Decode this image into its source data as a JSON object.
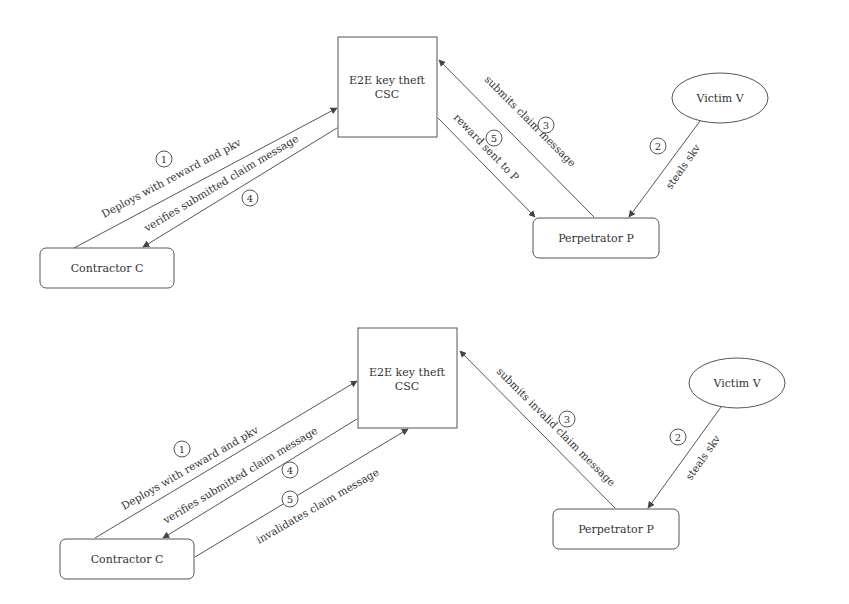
{
  "diagrams": [
    {
      "id": "top",
      "nodes": {
        "csc": {
          "line1": "E2E key theft",
          "line2": "CSC"
        },
        "contractor": {
          "label": "Contractor C"
        },
        "perpetrator": {
          "label": "Perpetrator P"
        },
        "victim": {
          "label": "Victim V"
        }
      },
      "edges": [
        {
          "step": "1",
          "label": "Deploys with reward and pkv",
          "from": "Contractor C",
          "to": "E2E key theft CSC"
        },
        {
          "step": "2",
          "label": "steals skv",
          "from": "Victim V",
          "to": "Perpetrator P"
        },
        {
          "step": "3",
          "label": "submits claim message",
          "from": "Perpetrator P",
          "to": "E2E key theft CSC"
        },
        {
          "step": "4",
          "label": "verifies submitted claim message",
          "from": "E2E key theft CSC",
          "to": "Contractor C"
        },
        {
          "step": "5",
          "label": "reward sent to P",
          "from": "E2E key theft CSC",
          "to": "Perpetrator P"
        }
      ]
    },
    {
      "id": "bottom",
      "nodes": {
        "csc": {
          "line1": "E2E key theft",
          "line2": "CSC"
        },
        "contractor": {
          "label": "Contractor C"
        },
        "perpetrator": {
          "label": "Perpetrator P"
        },
        "victim": {
          "label": "Victim V"
        }
      },
      "edges": [
        {
          "step": "1",
          "label": "Deploys with reward and pkv",
          "from": "Contractor C",
          "to": "E2E key theft CSC"
        },
        {
          "step": "2",
          "label": "steals skv",
          "from": "Victim V",
          "to": "Perpetrator P"
        },
        {
          "step": "3",
          "label": "submits invalid claim message",
          "from": "Perpetrator P",
          "to": "E2E key theft CSC"
        },
        {
          "step": "4",
          "label": "verifies submitted claim message",
          "from": "E2E key theft CSC",
          "to": "Contractor C"
        },
        {
          "step": "5",
          "label": "invalidates claim message",
          "from": "Contractor C",
          "to": "E2E key theft CSC"
        }
      ]
    }
  ]
}
